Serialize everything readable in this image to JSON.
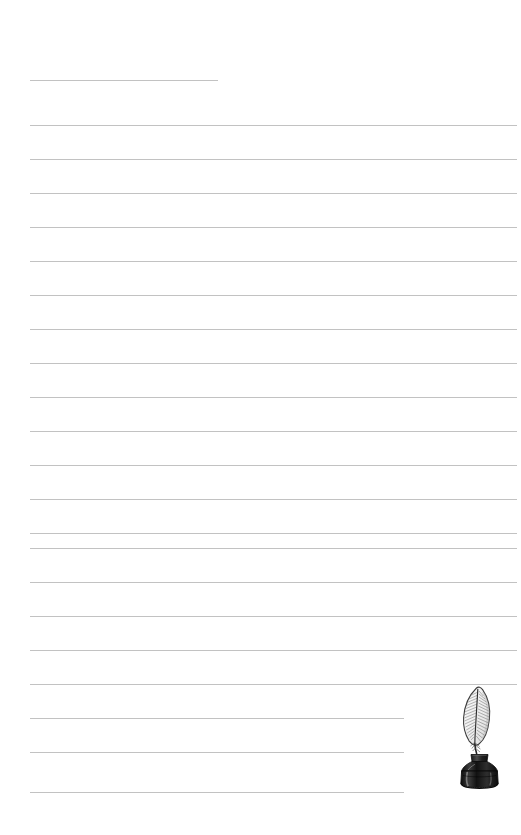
{
  "page": {
    "kind": "lined-stationery-sheet",
    "width": 521,
    "height": 835,
    "background_color": "#ffffff",
    "title_text": "",
    "body_text": ""
  },
  "ruling": {
    "line_color": "#c2c2c2",
    "line_thickness_px": 1,
    "left_margin_px": 30,
    "full_right_px": 517,
    "short_right_px": 404,
    "title_right_px": 218,
    "line_spacing_px": 34,
    "lines": [
      {
        "name": "title-rule",
        "y": 80,
        "x1": 30,
        "x2": 218,
        "variant": "title"
      },
      {
        "name": "rule-01",
        "y": 125,
        "x1": 30,
        "x2": 517,
        "variant": "full"
      },
      {
        "name": "rule-02",
        "y": 159,
        "x1": 30,
        "x2": 517,
        "variant": "full"
      },
      {
        "name": "rule-03",
        "y": 193,
        "x1": 30,
        "x2": 517,
        "variant": "full"
      },
      {
        "name": "rule-04",
        "y": 227,
        "x1": 30,
        "x2": 517,
        "variant": "full"
      },
      {
        "name": "rule-05",
        "y": 261,
        "x1": 30,
        "x2": 517,
        "variant": "full"
      },
      {
        "name": "rule-06",
        "y": 295,
        "x1": 30,
        "x2": 517,
        "variant": "full"
      },
      {
        "name": "rule-07",
        "y": 329,
        "x1": 30,
        "x2": 517,
        "variant": "full"
      },
      {
        "name": "rule-08",
        "y": 363,
        "x1": 30,
        "x2": 517,
        "variant": "full"
      },
      {
        "name": "rule-09",
        "y": 397,
        "x1": 30,
        "x2": 517,
        "variant": "full"
      },
      {
        "name": "rule-10",
        "y": 431,
        "x1": 30,
        "x2": 517,
        "variant": "full"
      },
      {
        "name": "rule-11",
        "y": 465,
        "x1": 30,
        "x2": 517,
        "variant": "full"
      },
      {
        "name": "rule-12",
        "y": 499,
        "x1": 30,
        "x2": 517,
        "variant": "full"
      },
      {
        "name": "rule-13",
        "y": 533,
        "x1": 30,
        "x2": 517,
        "variant": "full"
      },
      {
        "name": "rule-14",
        "y": 548,
        "x1": 30,
        "x2": 517,
        "variant": "full"
      },
      {
        "name": "rule-15",
        "y": 582,
        "x1": 30,
        "x2": 517,
        "variant": "full"
      },
      {
        "name": "rule-16",
        "y": 616,
        "x1": 30,
        "x2": 517,
        "variant": "full"
      },
      {
        "name": "rule-17",
        "y": 650,
        "x1": 30,
        "x2": 517,
        "variant": "full"
      },
      {
        "name": "rule-18",
        "y": 684,
        "x1": 30,
        "x2": 517,
        "variant": "full"
      },
      {
        "name": "rule-19",
        "y": 718,
        "x1": 30,
        "x2": 404,
        "variant": "short"
      },
      {
        "name": "rule-20",
        "y": 752,
        "x1": 30,
        "x2": 404,
        "variant": "short"
      },
      {
        "name": "rule-21",
        "y": 792,
        "x1": 30,
        "x2": 404,
        "variant": "short"
      }
    ]
  },
  "illustration": {
    "name": "quill-pen-and-inkwell-illustration",
    "description": "Feather quill standing in a dark glass ink bottle",
    "x": 448,
    "y": 686,
    "width": 70,
    "height": 104,
    "ink_color": "#1d1d1d",
    "bottle_color": "#2a2a2a",
    "feather_outline_color": "#3a3a3a",
    "feather_fill_color": "#f4f4f4"
  }
}
